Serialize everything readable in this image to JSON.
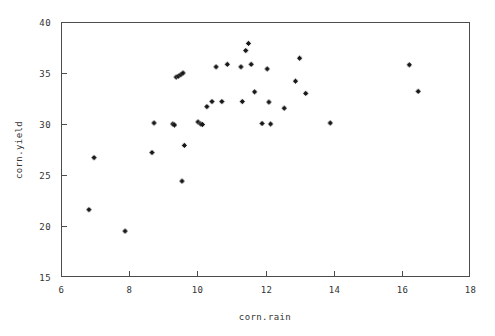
{
  "chart_data": {
    "type": "scatter",
    "title": "",
    "xlabel": "corn.rain",
    "ylabel": "corn.yield",
    "xlim": [
      6,
      18
    ],
    "ylim": [
      15,
      40
    ],
    "xticks": [
      6,
      8,
      10,
      12,
      14,
      16,
      18
    ],
    "yticks": [
      15,
      20,
      25,
      30,
      35,
      40
    ],
    "xticklabels": [
      "6",
      "8",
      "10",
      "12",
      "14",
      "16",
      "18"
    ],
    "yticklabels": [
      "15",
      "20",
      "25",
      "30",
      "35",
      "40"
    ],
    "grid": false,
    "legend": null,
    "marker": "star",
    "marker_color": "#1a1a1a",
    "frame_color": "#4d4d4d",
    "n_points": 38,
    "x": [
      6.97,
      6.82,
      7.88,
      8.73,
      8.67,
      9.28,
      9.38,
      9.45,
      9.52,
      9.33,
      9.58,
      9.55,
      9.62,
      10.02,
      10.1,
      10.15,
      10.28,
      10.43,
      10.55,
      10.72,
      10.88,
      11.28,
      11.32,
      11.42,
      11.5,
      11.58,
      11.68,
      11.9,
      12.05,
      12.1,
      12.15,
      12.55,
      12.88,
      13.0,
      13.18,
      13.9,
      16.22,
      16.48
    ],
    "y": [
      26.7,
      21.6,
      19.5,
      30.1,
      27.2,
      30.0,
      34.6,
      34.7,
      34.85,
      29.9,
      35.0,
      24.4,
      27.9,
      30.2,
      30.0,
      29.95,
      31.7,
      32.2,
      35.6,
      32.2,
      35.85,
      35.6,
      32.2,
      37.2,
      37.9,
      35.85,
      33.15,
      30.05,
      35.4,
      32.15,
      30.0,
      31.55,
      34.2,
      36.45,
      33.0,
      30.1,
      35.8,
      33.2
    ],
    "points": [
      {
        "rain": 6.97,
        "yield": 26.7
      },
      {
        "rain": 6.82,
        "yield": 21.6
      },
      {
        "rain": 7.88,
        "yield": 19.5
      },
      {
        "rain": 8.73,
        "yield": 30.1
      },
      {
        "rain": 8.67,
        "yield": 27.2
      },
      {
        "rain": 9.28,
        "yield": 30.0
      },
      {
        "rain": 9.38,
        "yield": 34.6
      },
      {
        "rain": 9.45,
        "yield": 34.7
      },
      {
        "rain": 9.52,
        "yield": 34.85
      },
      {
        "rain": 9.33,
        "yield": 29.9
      },
      {
        "rain": 9.58,
        "yield": 35.0
      },
      {
        "rain": 9.55,
        "yield": 24.4
      },
      {
        "rain": 9.62,
        "yield": 27.9
      },
      {
        "rain": 10.02,
        "yield": 30.2
      },
      {
        "rain": 10.1,
        "yield": 30.0
      },
      {
        "rain": 10.15,
        "yield": 29.95
      },
      {
        "rain": 10.28,
        "yield": 31.7
      },
      {
        "rain": 10.43,
        "yield": 32.2
      },
      {
        "rain": 10.55,
        "yield": 35.6
      },
      {
        "rain": 10.72,
        "yield": 32.2
      },
      {
        "rain": 10.88,
        "yield": 35.85
      },
      {
        "rain": 11.28,
        "yield": 35.6
      },
      {
        "rain": 11.32,
        "yield": 32.2
      },
      {
        "rain": 11.42,
        "yield": 37.2
      },
      {
        "rain": 11.5,
        "yield": 37.9
      },
      {
        "rain": 11.58,
        "yield": 35.85
      },
      {
        "rain": 11.68,
        "yield": 33.15
      },
      {
        "rain": 11.9,
        "yield": 30.05
      },
      {
        "rain": 12.05,
        "yield": 35.4
      },
      {
        "rain": 12.1,
        "yield": 32.15
      },
      {
        "rain": 12.15,
        "yield": 30.0
      },
      {
        "rain": 12.55,
        "yield": 31.55
      },
      {
        "rain": 12.88,
        "yield": 34.2
      },
      {
        "rain": 13.0,
        "yield": 36.45
      },
      {
        "rain": 13.18,
        "yield": 33.0
      },
      {
        "rain": 13.9,
        "yield": 30.1
      },
      {
        "rain": 16.22,
        "yield": 35.8
      },
      {
        "rain": 16.48,
        "yield": 33.2
      }
    ]
  },
  "figure": {
    "background": "#ffffff",
    "plot_area": {
      "left": 61,
      "top": 22,
      "right": 470,
      "bottom": 277
    }
  }
}
